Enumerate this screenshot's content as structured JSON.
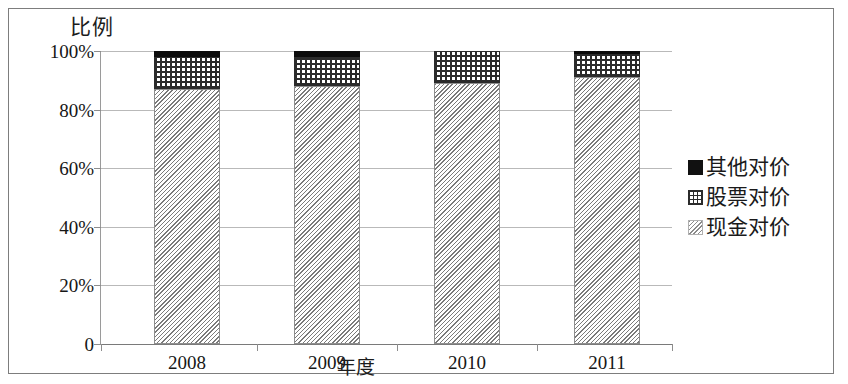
{
  "figure": {
    "y_axis_title": "比例",
    "x_axis_title": "年度"
  },
  "axis": {
    "y_ticks": [
      "100%",
      "80%",
      "60%",
      "40%",
      "20%",
      "0"
    ],
    "x_ticks": [
      "2008",
      "2009",
      "2010",
      "2011"
    ]
  },
  "legend": {
    "items": [
      {
        "label": "其他对价",
        "pattern": "solid-black",
        "color": "#111111"
      },
      {
        "label": "股票对价",
        "pattern": "crosshatch",
        "color": "#2b2b2b"
      },
      {
        "label": "现金对价",
        "pattern": "diagonal-hatch",
        "color": "#8a8a8a"
      }
    ]
  },
  "chart_data": {
    "type": "bar",
    "subtype": "stacked-100-percent",
    "title": "",
    "xlabel": "年度",
    "ylabel": "比例",
    "categories": [
      "2008",
      "2009",
      "2010",
      "2011"
    ],
    "series": [
      {
        "name": "现金对价",
        "values": [
          87,
          88,
          89,
          91
        ],
        "unit": "%",
        "pattern": "diagonal-hatch"
      },
      {
        "name": "股票对价",
        "values": [
          11,
          10,
          11,
          8
        ],
        "unit": "%",
        "pattern": "crosshatch"
      },
      {
        "name": "其他对价",
        "values": [
          2,
          2,
          0,
          1
        ],
        "unit": "%",
        "pattern": "solid-black"
      }
    ],
    "ylim": [
      0,
      100
    ],
    "ytick_labels": [
      "0",
      "20%",
      "40%",
      "60%",
      "80%",
      "100%"
    ],
    "ytick_values": [
      0,
      20,
      40,
      60,
      80,
      100
    ],
    "grid": true,
    "grid_axis": "y",
    "legend_position": "right"
  }
}
